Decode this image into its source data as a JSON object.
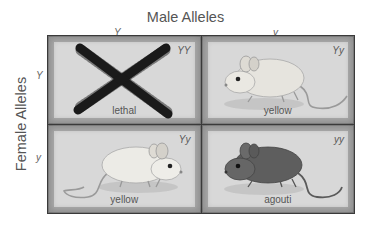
{
  "diagram": {
    "type": "punnett-square",
    "top_title": "Male Alleles",
    "left_title": "Female Alleles",
    "male_alleles": [
      "Y",
      "y"
    ],
    "female_alleles": [
      "Y",
      "y"
    ],
    "cells": [
      {
        "row": 0,
        "col": 0,
        "genotype": "YY",
        "phenotype": "lethal",
        "image": "crossed-out-x"
      },
      {
        "row": 0,
        "col": 1,
        "genotype": "Yy",
        "phenotype": "yellow",
        "image": "yellow-mouse"
      },
      {
        "row": 1,
        "col": 0,
        "genotype": "Yy",
        "phenotype": "yellow",
        "image": "yellow-mouse"
      },
      {
        "row": 1,
        "col": 1,
        "genotype": "yy",
        "phenotype": "agouti",
        "image": "agouti-mouse"
      }
    ]
  },
  "colors": {
    "grid_border": "#3a3a3a",
    "cell_frame": "#8e8e8e",
    "cell_panel": "#d8d8d8",
    "lethal_x": "#1a1a1a",
    "yellow_mouse": "#e4e2dc",
    "agouti_mouse": "#5a5a5a"
  }
}
